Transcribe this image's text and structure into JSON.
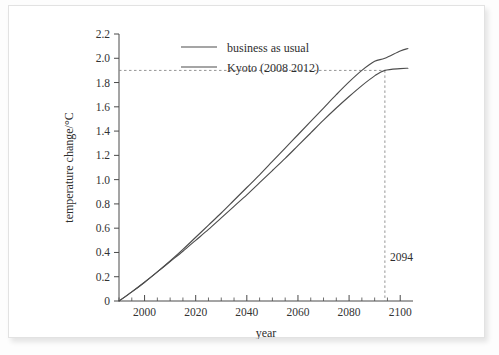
{
  "chart_data": {
    "type": "line",
    "title": "",
    "xlabel": "year",
    "ylabel": "temperature change/°C",
    "xlim": [
      1990,
      2105
    ],
    "ylim": [
      0,
      2.2
    ],
    "grid": false,
    "legend_position": "top-left-inside",
    "x_ticks": [
      2000,
      2020,
      2040,
      2060,
      2080,
      2100
    ],
    "x_tick_labels": [
      "2000",
      "2020",
      "2040",
      "2060",
      "2080",
      "2100"
    ],
    "x_minor_step": 5,
    "y_ticks": [
      0,
      0.2,
      0.4,
      0.6,
      0.8,
      1.0,
      1.2,
      1.4,
      1.6,
      1.8,
      2.0,
      2.2
    ],
    "y_tick_labels": [
      "0",
      "0.2",
      "0.4",
      "0.6",
      "0.8",
      "1.0",
      "1.2",
      "1.4",
      "1.6",
      "1.8",
      "2.0",
      "2.2"
    ],
    "series": [
      {
        "name": "business as usual",
        "color": "#4d4d4d",
        "x": [
          1990,
          1995,
          2000,
          2005,
          2010,
          2015,
          2020,
          2025,
          2030,
          2035,
          2040,
          2045,
          2050,
          2055,
          2060,
          2065,
          2070,
          2075,
          2080,
          2085,
          2090,
          2094,
          2100,
          2103
        ],
        "values": [
          0.0,
          0.075,
          0.155,
          0.24,
          0.33,
          0.425,
          0.525,
          0.625,
          0.725,
          0.83,
          0.935,
          1.04,
          1.15,
          1.26,
          1.37,
          1.48,
          1.59,
          1.7,
          1.805,
          1.9,
          1.975,
          2.0,
          2.06,
          2.08
        ]
      },
      {
        "name": "Kyoto (2008 – 2012)",
        "color": "#4d4d4d",
        "x": [
          1990,
          1995,
          2000,
          2005,
          2010,
          2015,
          2020,
          2025,
          2030,
          2035,
          2040,
          2045,
          2050,
          2055,
          2060,
          2065,
          2070,
          2075,
          2080,
          2085,
          2090,
          2094,
          2100,
          2103
        ],
        "values": [
          0.0,
          0.075,
          0.155,
          0.24,
          0.325,
          0.41,
          0.5,
          0.59,
          0.685,
          0.78,
          0.875,
          0.975,
          1.075,
          1.175,
          1.28,
          1.385,
          1.49,
          1.59,
          1.685,
          1.775,
          1.855,
          1.9,
          1.915,
          1.918
        ]
      }
    ],
    "annotations": [
      {
        "label": "2094",
        "x": 2094,
        "y": 1.9,
        "kind": "crosshair-guide",
        "color": "#8a8a8a"
      }
    ]
  },
  "legend": {
    "items": [
      {
        "label": "business as usual",
        "color": "#4d4d4d"
      },
      {
        "label": "Kyoto (2008  2012)",
        "color": "#4d4d4d"
      }
    ]
  },
  "axes": {
    "x_title": "year",
    "y_title": "temperature change/°C"
  },
  "colors": {
    "axis": "#4a4a4a",
    "guide": "#8a8a8a",
    "series": "#4d4d4d",
    "page_background": "#ffffff",
    "surround": "#fdfdfd"
  }
}
